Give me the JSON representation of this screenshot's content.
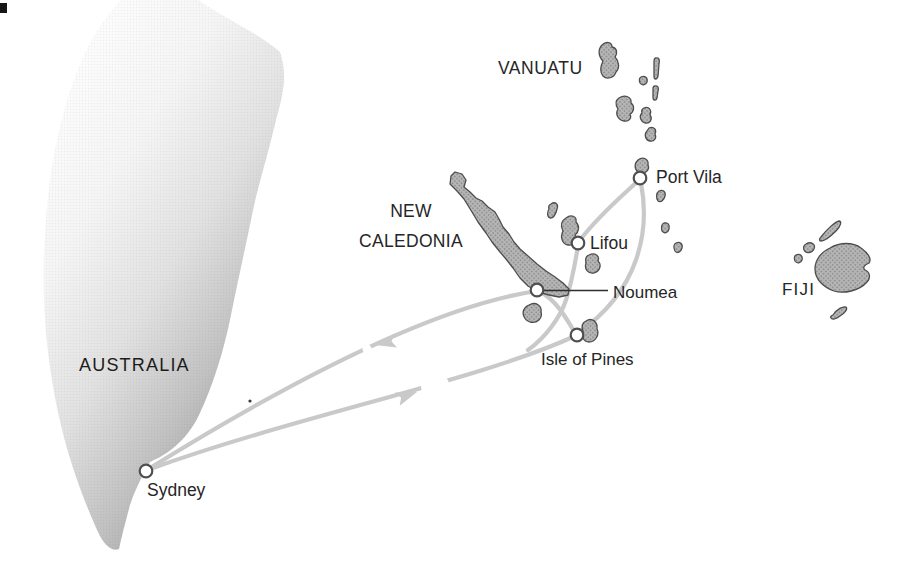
{
  "map": {
    "regions": [
      {
        "id": "australia",
        "label": "AUSTRALIA"
      },
      {
        "id": "vanuatu",
        "label": "VANUATU"
      },
      {
        "id": "new-caledonia",
        "label_line1": "NEW",
        "label_line2": "CALEDONIA"
      },
      {
        "id": "fiji",
        "label": "FIJI"
      }
    ],
    "ports": [
      {
        "id": "sydney",
        "label": "Sydney"
      },
      {
        "id": "port-vila",
        "label": "Port Vila"
      },
      {
        "id": "lifou",
        "label": "Lifou"
      },
      {
        "id": "noumea",
        "label": "Noumea"
      },
      {
        "id": "isle-of-pines",
        "label": "Isle of Pines"
      }
    ],
    "routes": [
      {
        "from": "Sydney",
        "to": "Isle of Pines",
        "arrow": "northeast"
      },
      {
        "from": "Noumea",
        "to": "Sydney",
        "arrow": "southwest"
      },
      {
        "from": "Noumea",
        "to": "Isle of Pines",
        "arrow": null
      },
      {
        "from": "Lifou",
        "to": "Isle of Pines",
        "arrow": null
      },
      {
        "from": "Port Vila",
        "to": "Lifou",
        "arrow": null
      },
      {
        "from": "Port Vila",
        "to": "Isle of Pines",
        "arrow": null
      }
    ],
    "colors": {
      "background": "#ffffff",
      "route": "#c9c9c9",
      "island_fill_base": "#b5b5b5",
      "island_fill_dot": "#8d8d8d",
      "island_outline": "#4d4d4d",
      "marker_fill": "#ffffff",
      "marker_outline": "#4f4f4f",
      "label_text": "#262626",
      "landmass_light": "#ffffff",
      "landmass_dark": "#8c8c8c"
    }
  }
}
